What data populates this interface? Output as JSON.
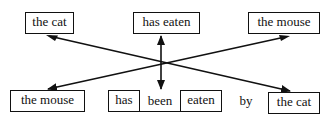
{
  "diagram": {
    "top_row": [
      {
        "label": "the cat"
      },
      {
        "label": "has eaten"
      },
      {
        "label": "the mouse"
      }
    ],
    "bottom_row": {
      "subject": "the mouse",
      "verb_parts": [
        "has",
        "been",
        "eaten"
      ],
      "preposition": "by",
      "agent": "the cat"
    },
    "arrows": [
      {
        "from": "the cat (top)",
        "to": "the cat (bottom)"
      },
      {
        "from": "the mouse (top)",
        "to": "the mouse (bottom)"
      },
      {
        "from": "has eaten (top)",
        "to": "has been eaten (bottom)"
      }
    ],
    "colors": {
      "ink": "#111111",
      "background": "#ffffff"
    }
  }
}
